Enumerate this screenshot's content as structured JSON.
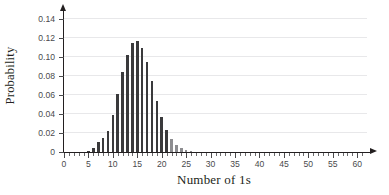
{
  "chart_data": {
    "type": "bar",
    "title": "",
    "xlabel": "Number of 1s",
    "ylabel": "Probability",
    "xlim": [
      0,
      62
    ],
    "ylim": [
      0,
      0.145
    ],
    "grid": true,
    "legend_position": "none",
    "x_tick_labels": [
      "0",
      "5",
      "10",
      "15",
      "20",
      "25",
      "30",
      "35",
      "40",
      "45",
      "50",
      "55",
      "60"
    ],
    "x_tick_values": [
      0,
      5,
      10,
      15,
      20,
      25,
      30,
      35,
      40,
      45,
      50,
      55,
      60
    ],
    "x_minor_tick_step": 1,
    "y_tick_labels": [
      "0",
      "0.02",
      "0.04",
      "0.06",
      "0.08",
      "0.10",
      "0.12",
      "0.14"
    ],
    "y_tick_values": [
      0,
      0.02,
      0.04,
      0.06,
      0.08,
      0.1,
      0.12,
      0.14
    ],
    "bar_color": "#3a3a3c",
    "grid_color": "#e8e8ea",
    "axis_color": "#231f20",
    "distribution": "binomial n=60 p=0.25",
    "categories": [
      4,
      5,
      6,
      7,
      8,
      9,
      10,
      11,
      12,
      13,
      14,
      15,
      16,
      17,
      18,
      19,
      20,
      21,
      22,
      23,
      24,
      25,
      26
    ],
    "values": [
      0.0012,
      0.0035,
      0.0086,
      0.0181,
      0.0337,
      0.0561,
      0.0842,
      0.1148,
      0.143,
      0.1637,
      0.1731,
      0.1702,
      0.156,
      0.1338,
      0.1077,
      0.0816,
      0.0584,
      0.0396,
      0.0255,
      0.0156,
      0.0091,
      0.0051,
      0.0027
    ]
  },
  "chart_render": {
    "bars": [
      {
        "x": 5,
        "p": 0.0015
      },
      {
        "x": 6,
        "p": 0.0045
      },
      {
        "x": 7,
        "p": 0.01
      },
      {
        "x": 8,
        "p": 0.0145
      },
      {
        "x": 9,
        "p": 0.0225
      },
      {
        "x": 10,
        "p": 0.039
      },
      {
        "x": 11,
        "p": 0.0605
      },
      {
        "x": 12,
        "p": 0.084
      },
      {
        "x": 13,
        "p": 0.102
      },
      {
        "x": 14,
        "p": 0.115
      },
      {
        "x": 15,
        "p": 0.117
      },
      {
        "x": 16,
        "p": 0.1095
      },
      {
        "x": 17,
        "p": 0.0945
      },
      {
        "x": 18,
        "p": 0.075
      },
      {
        "x": 19,
        "p": 0.054
      },
      {
        "x": 20,
        "p": 0.037
      },
      {
        "x": 21,
        "p": 0.023
      },
      {
        "x": 22,
        "p": 0.0135,
        "faint": true
      },
      {
        "x": 23,
        "p": 0.0075,
        "faint": true
      },
      {
        "x": 24,
        "p": 0.0038,
        "faint": true
      },
      {
        "x": 25,
        "p": 0.0018,
        "faint": true
      },
      {
        "x": 26,
        "p": 0.0008,
        "faint": true
      }
    ]
  }
}
